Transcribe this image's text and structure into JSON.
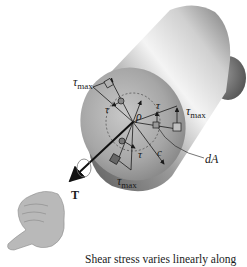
{
  "figure": {
    "labels": {
      "tau_max_top": {
        "symbol": "τ",
        "sub": "max"
      },
      "tau_max_right": {
        "symbol": "τ",
        "sub": "max"
      },
      "tau_max_bottom": {
        "symbol": "τ",
        "sub": "max"
      },
      "tau_left": "τ",
      "tau_right": "τ",
      "tau_bottom": "τ",
      "rho": "ρ",
      "c": "c",
      "dA": "dA",
      "torque": "T"
    },
    "caption": "Shear stress varies linearly along",
    "colors": {
      "shaft_light": "#f2f2f2",
      "shaft_dark": "#6e6e6e",
      "face": "#a8a8a8",
      "line": "#1a1a1a"
    }
  }
}
